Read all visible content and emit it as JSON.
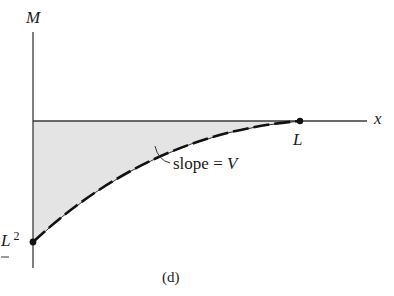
{
  "figure": {
    "caption": "(d)",
    "axes": {
      "y_label": "M",
      "x_label": "x"
    },
    "points": {
      "end_label": "L",
      "start_label_base": "L",
      "start_label_exp": "2"
    },
    "annotation": {
      "text_prefix": "slope = ",
      "text_var": "V"
    },
    "colors": {
      "line": "#2a2a2a",
      "fill": "#e4e4e4",
      "curve": "#111111"
    }
  }
}
